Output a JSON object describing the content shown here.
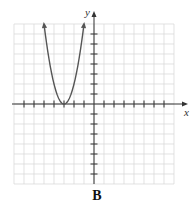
{
  "figure": {
    "caption": "B",
    "x_axis_label": "x",
    "y_axis_label": "y",
    "grid": {
      "x_min": -8,
      "x_max": 8,
      "y_min": -8,
      "y_max": 8,
      "step": 1
    },
    "curve": {
      "type": "parabola",
      "equation": "y = 2(x + 3)^2",
      "vertex": [
        -3,
        0
      ],
      "opens": "up",
      "endpoints_with_arrows": [
        [
          -5,
          8
        ],
        [
          -1,
          8
        ]
      ]
    },
    "colors": {
      "grid": "#d6d6d6",
      "axes": "#333333",
      "curve": "#555555"
    }
  }
}
